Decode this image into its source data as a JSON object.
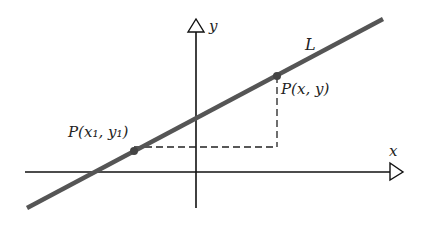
{
  "diagram": {
    "axes": {
      "x_label": "x",
      "y_label": "y"
    },
    "line": {
      "label": "L",
      "color": "#555555"
    },
    "points": [
      {
        "label": "P(x₁, y₁)",
        "name": "P1"
      },
      {
        "label": "P(x, y)",
        "name": "P"
      }
    ],
    "colors": {
      "axis": "#111111",
      "line": "#555555",
      "dash": "#222222",
      "background": "#ffffff"
    }
  }
}
